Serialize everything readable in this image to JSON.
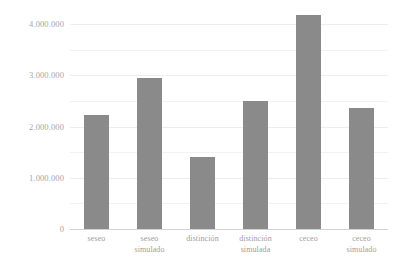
{
  "chart_data": {
    "type": "bar",
    "title": "",
    "subtitle": "",
    "xlabel": "",
    "ylabel": "",
    "categories": [
      "seseo",
      "seseo\nsimulado",
      "distinción",
      "distinción\nsimulada",
      "ceceo",
      "ceceo\nsimulado"
    ],
    "values": [
      2230000,
      2950000,
      1400000,
      2490000,
      4180000,
      2360000
    ],
    "ylim": [
      0,
      4200000
    ],
    "yticks": [
      0,
      1000000,
      2000000,
      3000000,
      4000000
    ],
    "ytick_labels": [
      "0",
      "1.000.000",
      "2.000.000",
      "3.000.000",
      "4.000.000"
    ],
    "minor_gridlines": [
      500000,
      1500000,
      2500000,
      3500000
    ],
    "grid": true,
    "legend": "none",
    "bar_color": "#8a8a8a",
    "gridline_color": "#f2f2f2",
    "axis_color": "#d2d2d2",
    "label_color": "#a6a6a6",
    "background": "#ffffff"
  }
}
